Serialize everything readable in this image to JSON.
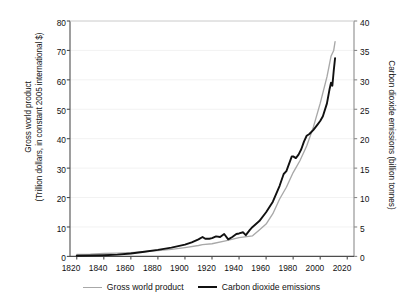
{
  "axes": {
    "left": {
      "title_line1": "Gross world product",
      "title_line2": "(Trillion dollars, in constant 2005 international $)",
      "ticks": [
        "0",
        "10",
        "20",
        "30",
        "40",
        "50",
        "60",
        "70",
        "80"
      ]
    },
    "right": {
      "title": "Carbon dioxide emissions (billion tonnes)",
      "ticks": [
        "0",
        "5",
        "10",
        "15",
        "20",
        "25",
        "30",
        "35",
        "40"
      ]
    },
    "bottom": {
      "ticks": [
        "1820",
        "1840",
        "1860",
        "1880",
        "1900",
        "1920",
        "1940",
        "1960",
        "1980",
        "2000",
        "2020"
      ]
    }
  },
  "legend": {
    "entries": [
      {
        "label": "Gross world product",
        "color": "#a8a8a8",
        "style": "thin-gray-line"
      },
      {
        "label": "Carbon dioxide emissions",
        "color": "#111111",
        "style": "thick-black-line"
      }
    ]
  },
  "chart_data": {
    "type": "line",
    "title": "",
    "xlabel": "",
    "ylabel": "Gross world product (Trillion dollars, in constant 2005 international $)",
    "y2label": "Carbon dioxide emissions (billion tonnes)",
    "xlim": [
      1815,
      2025
    ],
    "ylim": [
      0,
      80
    ],
    "y2lim": [
      0,
      40
    ],
    "xticks": [
      1820,
      1840,
      1860,
      1880,
      1900,
      1920,
      1940,
      1960,
      1980,
      2000,
      2020
    ],
    "yticks": [
      0,
      10,
      20,
      30,
      40,
      50,
      60,
      70,
      80
    ],
    "y2ticks": [
      0,
      5,
      10,
      15,
      20,
      25,
      30,
      35,
      40
    ],
    "grid": "horizontal-faint",
    "legend_position": "below-axis-center",
    "series": [
      {
        "name": "Gross world product",
        "axis": "left",
        "units": "trillion 2005 international $",
        "color": "#a8a8a8",
        "x": [
          1820,
          1830,
          1840,
          1850,
          1860,
          1870,
          1880,
          1890,
          1900,
          1910,
          1913,
          1920,
          1930,
          1940,
          1950,
          1955,
          1960,
          1965,
          1970,
          1975,
          1980,
          1985,
          1990,
          1995,
          2000,
          2005,
          2008,
          2010,
          2011
        ],
        "values": [
          0.7,
          0.8,
          1.0,
          1.1,
          1.3,
          1.6,
          2.0,
          2.4,
          3.0,
          3.7,
          4.0,
          4.3,
          5.3,
          6.4,
          7.0,
          9.0,
          11.0,
          14.5,
          19.5,
          23.5,
          28.5,
          32.5,
          37.5,
          44.0,
          52.0,
          61.0,
          68.0,
          70.0,
          73.0
        ]
      },
      {
        "name": "Carbon dioxide emissions",
        "axis": "right",
        "units": "billion tonnes CO2",
        "color": "#111111",
        "x": [
          1820,
          1830,
          1840,
          1850,
          1860,
          1870,
          1880,
          1890,
          1900,
          1905,
          1910,
          1913,
          1915,
          1918,
          1920,
          1923,
          1926,
          1929,
          1932,
          1935,
          1938,
          1940,
          1943,
          1945,
          1946,
          1948,
          1950,
          1955,
          1960,
          1965,
          1970,
          1973,
          1975,
          1979,
          1980,
          1982,
          1984,
          1986,
          1988,
          1990,
          1992,
          1995,
          1998,
          2000,
          2002,
          2005,
          2007,
          2008,
          2009,
          2010,
          2011
        ],
        "values": [
          0.1,
          0.15,
          0.2,
          0.3,
          0.5,
          0.8,
          1.1,
          1.5,
          2.0,
          2.4,
          2.9,
          3.3,
          3.0,
          3.0,
          3.1,
          3.4,
          3.3,
          3.8,
          2.9,
          3.3,
          3.8,
          3.9,
          4.1,
          3.6,
          3.9,
          4.5,
          5.0,
          6.0,
          7.5,
          9.3,
          12.0,
          14.0,
          14.5,
          17.0,
          17.0,
          16.7,
          17.3,
          18.2,
          19.5,
          20.5,
          20.8,
          21.5,
          22.4,
          23.0,
          23.8,
          26.0,
          28.5,
          29.5,
          29.0,
          31.5,
          33.7
        ]
      }
    ]
  }
}
